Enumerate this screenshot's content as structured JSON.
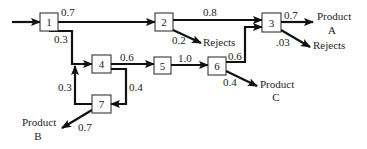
{
  "nodes": [
    {
      "id": "1",
      "label": "1"
    },
    {
      "id": "2",
      "label": "2"
    },
    {
      "id": "3",
      "label": "3"
    },
    {
      "id": "4",
      "label": "4"
    },
    {
      "id": "5",
      "label": "5"
    },
    {
      "id": "6",
      "label": "6"
    },
    {
      "id": "7",
      "label": "7"
    }
  ],
  "edges": [
    {
      "from": "input",
      "to": "1",
      "label": ""
    },
    {
      "from": "1",
      "to": "2",
      "label": "0.7"
    },
    {
      "from": "1",
      "to": "4",
      "label": "0.3"
    },
    {
      "from": "2",
      "to": "3",
      "label": "0.8"
    },
    {
      "from": "2",
      "to": "rejects-1",
      "label": "0.2"
    },
    {
      "from": "4",
      "to": "5",
      "label": "0.6"
    },
    {
      "from": "4",
      "to": "7",
      "label": "0.4"
    },
    {
      "from": "7",
      "to": "4",
      "label": "0.3"
    },
    {
      "from": "7",
      "to": "product-b",
      "label": "0.7"
    },
    {
      "from": "5",
      "to": "6",
      "label": "1.0"
    },
    {
      "from": "6",
      "to": "3",
      "label": "0.6"
    },
    {
      "from": "6",
      "to": "product-c",
      "label": "0.4"
    },
    {
      "from": "3",
      "to": "product-a",
      "label": "0.7"
    },
    {
      "from": "3",
      "to": "rejects-2",
      "label": ".03"
    }
  ],
  "outputs": {
    "rejects_1": "Rejects",
    "rejects_2": "Rejects",
    "product_a": [
      "Product",
      "A"
    ],
    "product_b": [
      "Product",
      "B"
    ],
    "product_c": [
      "Product",
      "C"
    ]
  }
}
